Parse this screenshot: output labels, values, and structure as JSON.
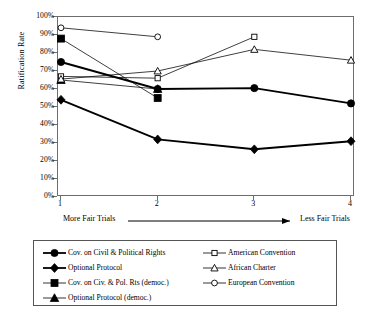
{
  "chart": {
    "type": "line",
    "ylabel": "Ratification Rate",
    "xlabel_left": "More Fair Trials",
    "xlabel_right": "Less Fair Trials",
    "x": [
      1,
      2,
      3,
      4
    ],
    "xticklabels": [
      "1",
      "2",
      "3",
      "4"
    ],
    "yticklabels": [
      "0%",
      "10%",
      "20%",
      "30%",
      "40%",
      "50%",
      "60%",
      "70%",
      "80%",
      "90%",
      "100%"
    ],
    "yticks": [
      0,
      10,
      20,
      30,
      40,
      50,
      60,
      70,
      80,
      90,
      100
    ],
    "ylim": [
      0,
      100
    ],
    "grid": false,
    "legend_position": "below-axes",
    "axis_color": "#6d6d6d",
    "series": [
      {
        "name": "Cov. on Civil & Political Rights",
        "marker": "filled-circle",
        "line": "thick",
        "color": "#000000",
        "x": [
          1,
          2,
          3,
          4
        ],
        "values": [
          75,
          60,
          60.5,
          52
        ]
      },
      {
        "name": "Optional Protocol",
        "marker": "filled-diamond",
        "line": "thick",
        "color": "#000000",
        "x": [
          1,
          2,
          3,
          4
        ],
        "values": [
          54,
          32,
          26.5,
          31
        ]
      },
      {
        "name": "Cov. on Civ. & Pol. Rts (democ.)",
        "marker": "filled-square",
        "line": "thin",
        "color": "#000000",
        "x": [
          1,
          2
        ],
        "values": [
          88,
          55
        ]
      },
      {
        "name": "Optional Protocol (democ.)",
        "marker": "filled-triangle",
        "line": "thin",
        "color": "#000000",
        "x": [
          1,
          2
        ],
        "values": [
          65,
          60
        ]
      },
      {
        "name": "American Convention",
        "marker": "open-square",
        "line": "thin",
        "color": "#000000",
        "x": [
          1,
          2,
          3
        ],
        "values": [
          67,
          66,
          89
        ]
      },
      {
        "name": "African Charter",
        "marker": "open-triangle",
        "line": "thin",
        "color": "#000000",
        "x": [
          1,
          2,
          3,
          4
        ],
        "values": [
          65.5,
          70,
          82,
          76
        ]
      },
      {
        "name": "European Convention",
        "marker": "open-circle",
        "line": "thin",
        "color": "#000000",
        "x": [
          1,
          2
        ],
        "values": [
          94,
          89
        ]
      }
    ]
  },
  "legend": {
    "column_a": [
      "Cov. on Civil & Political Rights",
      "Optional Protocol",
      "Cov. on Civ. & Pol. Rts (democ.)",
      "Optional Protocol (democ.)"
    ],
    "column_b": [
      "American Convention",
      "African Charter",
      "European Convention"
    ]
  }
}
